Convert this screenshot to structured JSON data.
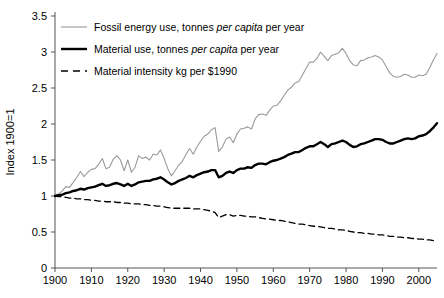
{
  "chart_data": {
    "type": "line",
    "title": "",
    "subtitle": "",
    "xlabel": "",
    "ylabel": "Index 1900=1",
    "xlim": [
      1900,
      2005
    ],
    "ylim": [
      0,
      3.5
    ],
    "xticks": [
      1900,
      1910,
      1920,
      1930,
      1940,
      1950,
      1960,
      1970,
      1980,
      1990,
      2000
    ],
    "yticks": [
      0,
      0.5,
      1,
      1.5,
      2,
      2.5,
      3,
      3.5
    ],
    "ytick_labels": [
      "0",
      "0.5",
      "1",
      "1.5",
      "2",
      "2.5",
      "3",
      "3.5"
    ],
    "xtick_labels": [
      "1900",
      "1910",
      "1920",
      "1930",
      "1940",
      "1950",
      "1960",
      "1970",
      "1980",
      "1990",
      "2000"
    ],
    "grid": false,
    "legend_position": "top-left",
    "series": [
      {
        "name": "fossil-energy-use",
        "label_parts": [
          "Fossil energy use, tonnes ",
          "per capita",
          " per year"
        ],
        "label": "Fossil energy use, tonnes per capita per year",
        "color": "#9a9a9a",
        "style": "solid",
        "width": 1.1,
        "x": [
          1900,
          1901,
          1902,
          1903,
          1904,
          1905,
          1906,
          1907,
          1908,
          1909,
          1910,
          1911,
          1912,
          1913,
          1914,
          1915,
          1916,
          1917,
          1918,
          1919,
          1920,
          1921,
          1922,
          1923,
          1924,
          1925,
          1926,
          1927,
          1928,
          1929,
          1930,
          1931,
          1932,
          1933,
          1934,
          1935,
          1936,
          1937,
          1938,
          1939,
          1940,
          1941,
          1942,
          1943,
          1944,
          1945,
          1946,
          1947,
          1948,
          1949,
          1950,
          1951,
          1952,
          1953,
          1954,
          1955,
          1956,
          1957,
          1958,
          1959,
          1960,
          1961,
          1962,
          1963,
          1964,
          1965,
          1966,
          1967,
          1968,
          1969,
          1970,
          1971,
          1972,
          1973,
          1974,
          1975,
          1976,
          1977,
          1978,
          1979,
          1980,
          1981,
          1982,
          1983,
          1984,
          1985,
          1986,
          1987,
          1988,
          1989,
          1990,
          1991,
          1992,
          1993,
          1994,
          1995,
          1996,
          1997,
          1998,
          1999,
          2000,
          2001,
          2002,
          2003,
          2004,
          2005
        ],
        "values": [
          1.0,
          1.03,
          1.07,
          1.13,
          1.12,
          1.19,
          1.26,
          1.34,
          1.27,
          1.33,
          1.37,
          1.38,
          1.44,
          1.52,
          1.38,
          1.4,
          1.51,
          1.56,
          1.5,
          1.35,
          1.5,
          1.33,
          1.4,
          1.56,
          1.52,
          1.54,
          1.5,
          1.58,
          1.57,
          1.64,
          1.52,
          1.38,
          1.28,
          1.35,
          1.43,
          1.48,
          1.58,
          1.66,
          1.58,
          1.68,
          1.76,
          1.83,
          1.86,
          1.92,
          1.95,
          1.62,
          1.68,
          1.79,
          1.82,
          1.74,
          1.86,
          1.93,
          1.94,
          1.96,
          1.93,
          2.07,
          2.13,
          2.14,
          2.12,
          2.19,
          2.25,
          2.26,
          2.32,
          2.4,
          2.47,
          2.51,
          2.57,
          2.59,
          2.68,
          2.77,
          2.86,
          2.86,
          2.91,
          3.0,
          2.94,
          2.88,
          2.95,
          2.97,
          2.99,
          3.05,
          2.98,
          2.88,
          2.82,
          2.81,
          2.88,
          2.89,
          2.92,
          2.93,
          2.95,
          2.93,
          2.89,
          2.8,
          2.71,
          2.66,
          2.65,
          2.66,
          2.69,
          2.68,
          2.65,
          2.65,
          2.68,
          2.67,
          2.69,
          2.78,
          2.89,
          2.98
        ]
      },
      {
        "name": "material-use",
        "label_parts": [
          "Material use, tonnes ",
          "per capita",
          " per year"
        ],
        "label": "Material use, tonnes per capita per year",
        "color": "#000000",
        "style": "solid",
        "width": 2.4,
        "x": [
          1900,
          1901,
          1902,
          1903,
          1904,
          1905,
          1906,
          1907,
          1908,
          1909,
          1910,
          1911,
          1912,
          1913,
          1914,
          1915,
          1916,
          1917,
          1918,
          1919,
          1920,
          1921,
          1922,
          1923,
          1924,
          1925,
          1926,
          1927,
          1928,
          1929,
          1930,
          1931,
          1932,
          1933,
          1934,
          1935,
          1936,
          1937,
          1938,
          1939,
          1940,
          1941,
          1942,
          1943,
          1944,
          1945,
          1946,
          1947,
          1948,
          1949,
          1950,
          1951,
          1952,
          1953,
          1954,
          1955,
          1956,
          1957,
          1958,
          1959,
          1960,
          1961,
          1962,
          1963,
          1964,
          1965,
          1966,
          1967,
          1968,
          1969,
          1970,
          1971,
          1972,
          1973,
          1974,
          1975,
          1976,
          1977,
          1978,
          1979,
          1980,
          1981,
          1982,
          1983,
          1984,
          1985,
          1986,
          1987,
          1988,
          1989,
          1990,
          1991,
          1992,
          1993,
          1994,
          1995,
          1996,
          1997,
          1998,
          1999,
          2000,
          2001,
          2002,
          2003,
          2004,
          2005
        ],
        "values": [
          1.0,
          1.01,
          1.02,
          1.04,
          1.05,
          1.07,
          1.08,
          1.1,
          1.09,
          1.11,
          1.12,
          1.13,
          1.15,
          1.17,
          1.14,
          1.15,
          1.17,
          1.18,
          1.16,
          1.14,
          1.17,
          1.14,
          1.16,
          1.19,
          1.2,
          1.21,
          1.21,
          1.23,
          1.24,
          1.26,
          1.23,
          1.19,
          1.16,
          1.18,
          1.21,
          1.23,
          1.25,
          1.28,
          1.26,
          1.29,
          1.31,
          1.33,
          1.34,
          1.36,
          1.36,
          1.26,
          1.28,
          1.32,
          1.34,
          1.32,
          1.36,
          1.38,
          1.38,
          1.4,
          1.39,
          1.43,
          1.45,
          1.45,
          1.44,
          1.47,
          1.49,
          1.5,
          1.52,
          1.54,
          1.57,
          1.59,
          1.61,
          1.61,
          1.64,
          1.67,
          1.69,
          1.69,
          1.72,
          1.75,
          1.72,
          1.68,
          1.72,
          1.73,
          1.75,
          1.77,
          1.75,
          1.71,
          1.68,
          1.69,
          1.72,
          1.73,
          1.75,
          1.77,
          1.79,
          1.79,
          1.78,
          1.75,
          1.73,
          1.73,
          1.75,
          1.77,
          1.79,
          1.8,
          1.79,
          1.8,
          1.83,
          1.84,
          1.86,
          1.9,
          1.95,
          2.01
        ]
      },
      {
        "name": "material-intensity",
        "label_parts": [
          "Material intensity kg per $1990"
        ],
        "label": "Material intensity kg per $1990",
        "color": "#000000",
        "style": "dashed",
        "width": 1.3,
        "x": [
          1900,
          1901,
          1902,
          1903,
          1904,
          1905,
          1906,
          1907,
          1908,
          1909,
          1910,
          1911,
          1912,
          1913,
          1914,
          1915,
          1916,
          1917,
          1918,
          1919,
          1920,
          1921,
          1922,
          1923,
          1924,
          1925,
          1926,
          1927,
          1928,
          1929,
          1930,
          1931,
          1932,
          1933,
          1934,
          1935,
          1936,
          1937,
          1938,
          1939,
          1940,
          1941,
          1942,
          1943,
          1944,
          1945,
          1946,
          1947,
          1948,
          1949,
          1950,
          1951,
          1952,
          1953,
          1954,
          1955,
          1956,
          1957,
          1958,
          1959,
          1960,
          1961,
          1962,
          1963,
          1964,
          1965,
          1966,
          1967,
          1968,
          1969,
          1970,
          1971,
          1972,
          1973,
          1974,
          1975,
          1976,
          1977,
          1978,
          1979,
          1980,
          1981,
          1982,
          1983,
          1984,
          1985,
          1986,
          1987,
          1988,
          1989,
          1990,
          1991,
          1992,
          1993,
          1994,
          1995,
          1996,
          1997,
          1998,
          1999,
          2000,
          2001,
          2002,
          2003,
          2004,
          2005
        ],
        "values": [
          1.0,
          0.99,
          0.99,
          0.98,
          0.97,
          0.97,
          0.96,
          0.96,
          0.95,
          0.95,
          0.94,
          0.94,
          0.93,
          0.93,
          0.92,
          0.92,
          0.92,
          0.91,
          0.91,
          0.9,
          0.9,
          0.89,
          0.89,
          0.89,
          0.88,
          0.88,
          0.87,
          0.87,
          0.86,
          0.86,
          0.85,
          0.84,
          0.83,
          0.83,
          0.83,
          0.83,
          0.83,
          0.83,
          0.82,
          0.82,
          0.82,
          0.81,
          0.8,
          0.79,
          0.77,
          0.7,
          0.72,
          0.74,
          0.74,
          0.72,
          0.73,
          0.73,
          0.72,
          0.72,
          0.71,
          0.71,
          0.7,
          0.69,
          0.68,
          0.68,
          0.67,
          0.66,
          0.66,
          0.65,
          0.64,
          0.63,
          0.62,
          0.61,
          0.61,
          0.6,
          0.59,
          0.58,
          0.58,
          0.57,
          0.56,
          0.55,
          0.55,
          0.54,
          0.53,
          0.53,
          0.52,
          0.51,
          0.5,
          0.49,
          0.49,
          0.48,
          0.48,
          0.47,
          0.47,
          0.46,
          0.46,
          0.45,
          0.44,
          0.44,
          0.43,
          0.43,
          0.42,
          0.42,
          0.41,
          0.41,
          0.4,
          0.4,
          0.39,
          0.39,
          0.38,
          0.37
        ]
      }
    ]
  }
}
